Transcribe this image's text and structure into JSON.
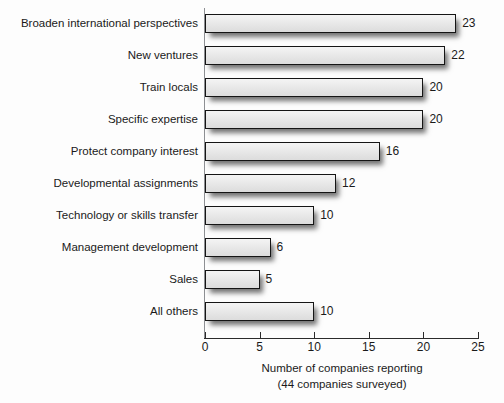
{
  "chart_data": {
    "type": "bar",
    "orientation": "horizontal",
    "title": "",
    "xlabel": "Number of companies reporting",
    "xlabel_sub": "(44 companies surveyed)",
    "ylabel": "",
    "xlim": [
      0,
      25
    ],
    "xticks": [
      0,
      5,
      10,
      15,
      20,
      25
    ],
    "xtick_labels": [
      "0",
      "5",
      "10",
      "15",
      "20",
      "25"
    ],
    "grid": false,
    "legend": false,
    "categories": [
      "Broaden international perspectives",
      "New ventures",
      "Train locals",
      "Specific expertise",
      "Protect company interest",
      "Developmental assignments",
      "Technology or skills transfer",
      "Management development",
      "Sales",
      "All others"
    ],
    "values": [
      23,
      22,
      20,
      20,
      16,
      12,
      10,
      6,
      5,
      10
    ],
    "value_labels": [
      "23",
      "22",
      "20",
      "20",
      "16",
      "12",
      "10",
      "6",
      "5",
      "10"
    ],
    "bar_fill_color": "#e8e8e8",
    "bar_border_color": "#151515",
    "background_color": "#fdfdfd"
  }
}
